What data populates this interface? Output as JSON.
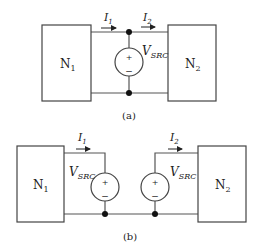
{
  "diagram_a": {
    "caption": "(a)",
    "network_left": {
      "name": "N",
      "sub": "1"
    },
    "network_right": {
      "name": "N",
      "sub": "2"
    },
    "current_left": {
      "name": "I",
      "sub": "1"
    },
    "current_right": {
      "name": "I",
      "sub": "2"
    },
    "source": {
      "name": "V",
      "sub": "SRC",
      "plus": "+",
      "minus": "−"
    }
  },
  "diagram_b": {
    "caption": "(b)",
    "network_left": {
      "name": "N",
      "sub": "1"
    },
    "network_right": {
      "name": "N",
      "sub": "2"
    },
    "current_left": {
      "name": "I",
      "sub": "1"
    },
    "current_right": {
      "name": "I",
      "sub": "2"
    },
    "source_left": {
      "name": "V",
      "sub": "SRC",
      "plus": "+",
      "minus": "−"
    },
    "source_right": {
      "name": "V",
      "sub": "SRC",
      "plus": "+",
      "minus": "−"
    }
  }
}
